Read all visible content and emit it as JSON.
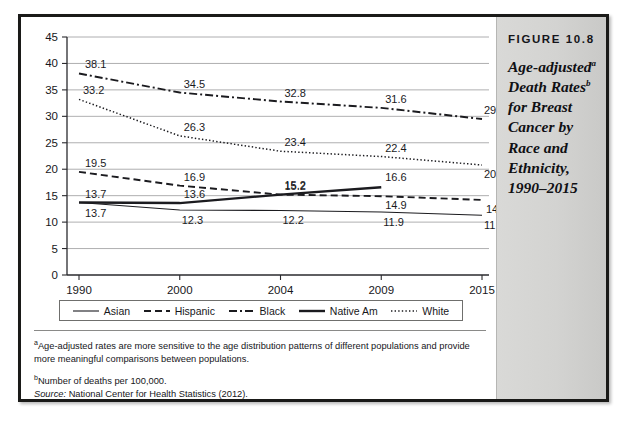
{
  "figure": {
    "number_label": "FIGURE 10.8",
    "title_lines": [
      "Age-adjusted",
      "Death Rates",
      "for Breast",
      "Cancer by",
      "Race and",
      "Ethnicity,",
      "1990–2015"
    ],
    "title_sup_a": "a",
    "title_sup_b": "b"
  },
  "footnotes": {
    "a_marker": "a",
    "a_text": "Age-adjusted rates are more sensitive to the age distribution patterns of different populations and provide more meaningful comparisons between populations.",
    "b_marker": "b",
    "b_text": "Number of deaths per 100,000.",
    "source_label": "Source:",
    "source_text": " National Center for Health Statistics (2012)."
  },
  "colors": {
    "line": "#1b1b1f",
    "grid": "#9a9a9c",
    "axis": "#2a2a2e",
    "panel_bg": "#d6d6d4",
    "frame": "#1a1a18"
  },
  "chart_data": {
    "type": "line",
    "xlabel": "",
    "ylabel": "",
    "categories": [
      "1990",
      "2000",
      "2004",
      "2009",
      "2015"
    ],
    "ylim": [
      0,
      45
    ],
    "yticks": [
      0,
      5,
      10,
      15,
      20,
      25,
      30,
      35,
      40,
      45
    ],
    "ytick_labels": [
      "0",
      "5",
      "10",
      "15",
      "20",
      "25",
      "30",
      "35",
      "40",
      "45"
    ],
    "grid": true,
    "legend_position": "bottom",
    "series": [
      {
        "name": "Asian",
        "style": "solid-thin",
        "values": [
          13.7,
          12.3,
          12.2,
          11.9,
          11.3
        ],
        "labels": [
          "13.7",
          "12.3",
          "12.2",
          "11.9",
          "11.3"
        ]
      },
      {
        "name": "Hispanic",
        "style": "dashed",
        "values": [
          19.5,
          16.9,
          15.2,
          14.9,
          14.2
        ],
        "labels": [
          "19.5",
          "16.9",
          "15.2",
          "14.9",
          "14.2"
        ]
      },
      {
        "name": "Black",
        "style": "dash-dot",
        "values": [
          38.1,
          34.5,
          32.8,
          31.6,
          29.5
        ],
        "labels": [
          "38.1",
          "34.5",
          "32.8",
          "31.6",
          "29.5"
        ]
      },
      {
        "name": "Native Am",
        "style": "solid-thick",
        "values": [
          13.7,
          13.6,
          15.2,
          16.6,
          null
        ],
        "labels": [
          "13.7",
          "13.6",
          "15.2",
          "16.6",
          ""
        ]
      },
      {
        "name": "White",
        "style": "dotted",
        "values": [
          33.2,
          26.3,
          23.4,
          22.4,
          20.8
        ],
        "labels": [
          "33.2",
          "26.3",
          "23.4",
          "22.4",
          "20.8"
        ]
      }
    ]
  }
}
